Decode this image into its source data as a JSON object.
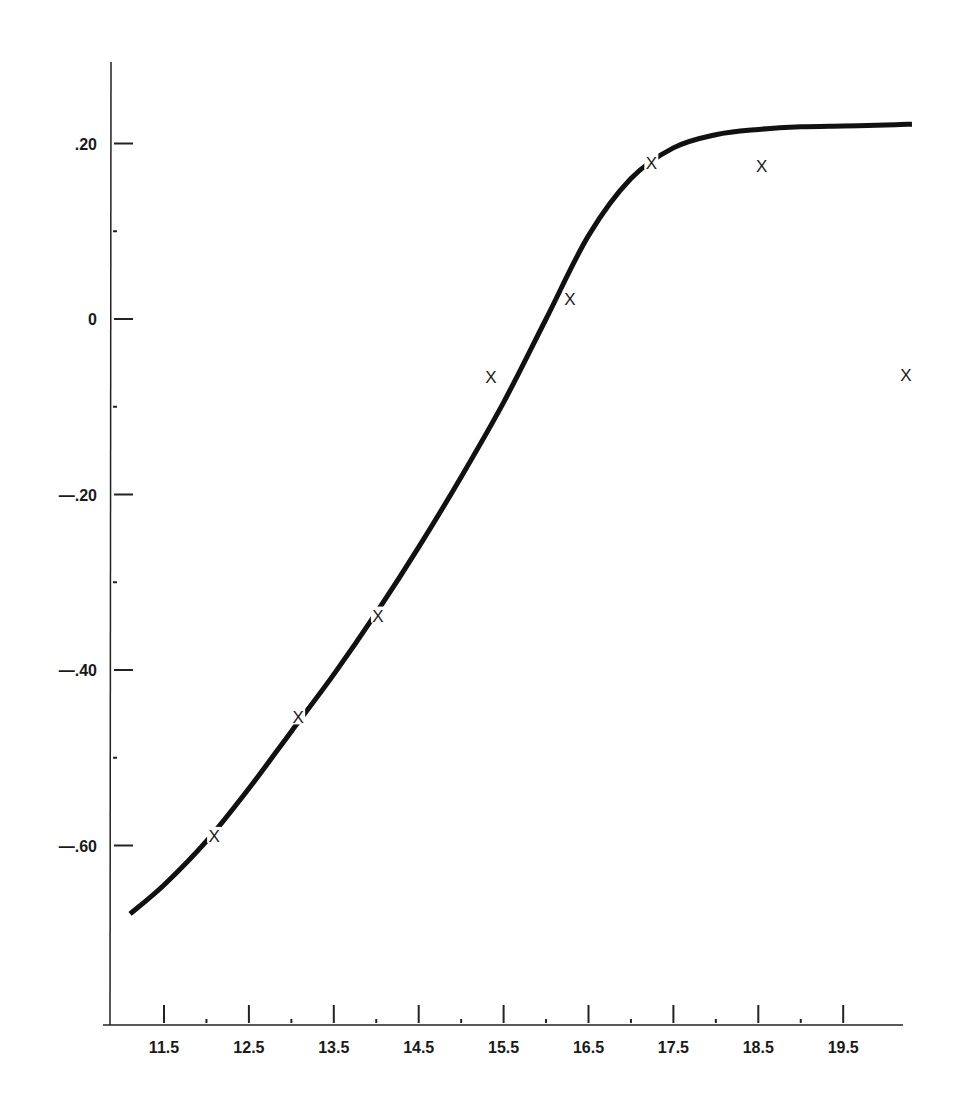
{
  "chart_data": {
    "type": "line",
    "title": "",
    "xlabel": "",
    "ylabel": "",
    "xlim": [
      11.0,
      20.4
    ],
    "ylim": [
      -0.8,
      0.3
    ],
    "grid": false,
    "legend": null,
    "x_ticks": [
      11.5,
      12.5,
      13.5,
      14.5,
      15.5,
      16.5,
      17.5,
      18.5,
      19.5
    ],
    "x_tick_labels": [
      "11.5",
      "12.5",
      "13.5",
      "14.5",
      "15.5",
      "16.5",
      "17.5",
      "18.5",
      "19.5"
    ],
    "x_minor_ticks": [
      12.0,
      13.0,
      14.0,
      15.0,
      16.0,
      17.0,
      18.0,
      19.0
    ],
    "y_ticks": [
      0.2,
      0.0,
      -0.2,
      -0.4,
      -0.6
    ],
    "y_tick_labels": [
      ".20",
      "0",
      "—.20",
      "—.40",
      "—.60"
    ],
    "y_minor_ticks": [
      0.1,
      -0.1,
      -0.3,
      -0.5
    ],
    "series": [
      {
        "name": "fitted curve",
        "type": "line",
        "x": [
          11.1,
          11.5,
          12.0,
          12.5,
          13.0,
          13.5,
          14.0,
          14.5,
          15.0,
          15.5,
          16.0,
          16.5,
          17.0,
          17.5,
          18.0,
          18.5,
          19.0,
          19.5,
          20.0,
          20.31
        ],
        "values": [
          -0.678,
          -0.645,
          -0.595,
          -0.535,
          -0.47,
          -0.405,
          -0.335,
          -0.26,
          -0.18,
          -0.095,
          0.0,
          0.095,
          0.16,
          0.195,
          0.21,
          0.216,
          0.219,
          0.22,
          0.221,
          0.222
        ]
      },
      {
        "name": "observations",
        "type": "scatter",
        "marker": "x",
        "x": [
          12.09,
          13.08,
          14.02,
          15.35,
          16.28,
          17.24,
          18.54,
          20.24
        ],
        "values": [
          -0.589,
          -0.454,
          -0.338,
          -0.066,
          0.023,
          0.178,
          0.174,
          -0.064
        ]
      }
    ]
  },
  "markers": {
    "glyph": "X"
  }
}
